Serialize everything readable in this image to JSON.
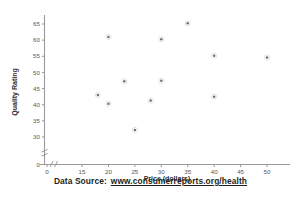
{
  "chart_data": {
    "type": "scatter",
    "title": "",
    "xlabel": "Price (dollars)",
    "ylabel": "Quality Rating",
    "xlim": [
      0,
      52
    ],
    "ylim": [
      0,
      68
    ],
    "xticks": [
      0,
      15,
      20,
      25,
      30,
      35,
      40,
      45,
      50
    ],
    "yticks": [
      0,
      30,
      35,
      40,
      45,
      50,
      55,
      60,
      65
    ],
    "x_axis_break": true,
    "y_axis_break": true,
    "grid": false,
    "legend": "none",
    "marker_color": "#6d6e71",
    "points": [
      {
        "x": 18,
        "y": 43.0
      },
      {
        "x": 20,
        "y": 61.0
      },
      {
        "x": 20,
        "y": 40.3
      },
      {
        "x": 23,
        "y": 47.3
      },
      {
        "x": 25,
        "y": 32.2
      },
      {
        "x": 28,
        "y": 41.3
      },
      {
        "x": 30,
        "y": 60.3
      },
      {
        "x": 30,
        "y": 47.4
      },
      {
        "x": 35,
        "y": 65.2
      },
      {
        "x": 40,
        "y": 55.2
      },
      {
        "x": 40,
        "y": 42.5
      },
      {
        "x": 50,
        "y": 54.6
      }
    ]
  },
  "axes": {
    "x_title": "Price (dollars)",
    "y_title": "Quality Rating",
    "x_tick_labels": [
      "0",
      "15",
      "20",
      "25",
      "30",
      "35",
      "40",
      "45",
      "50"
    ],
    "y_tick_labels": [
      "0",
      "30",
      "35",
      "40",
      "45",
      "50",
      "55",
      "60",
      "65"
    ]
  },
  "footer": {
    "source_label": "Data Source:",
    "source_url": "www.consumerreports.org/health"
  },
  "colors": {
    "axis": "#9a9a9c",
    "marker": "#6d6e71",
    "text": "#231f20"
  }
}
